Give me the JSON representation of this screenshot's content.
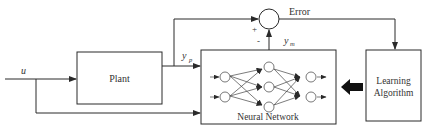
{
  "diagram": {
    "type": "block-diagram",
    "colors": {
      "line": "#2a2a2a",
      "text": "#333333",
      "background": "#ffffff"
    },
    "blocks": {
      "plant": {
        "label": "Plant"
      },
      "neural_network": {
        "label": "Neural Network"
      },
      "learning_algorithm": {
        "label_line1": "Learning",
        "label_line2": "Algorithm"
      }
    },
    "signals": {
      "input": "u",
      "plant_output": "y",
      "plant_output_sub": "p",
      "model_output": "y",
      "model_output_sub": "m",
      "error": "Error"
    },
    "summing_junction": {
      "plus_sign": "+",
      "minus_sign": "-"
    },
    "network": {
      "layers": [
        2,
        3,
        2
      ]
    }
  }
}
